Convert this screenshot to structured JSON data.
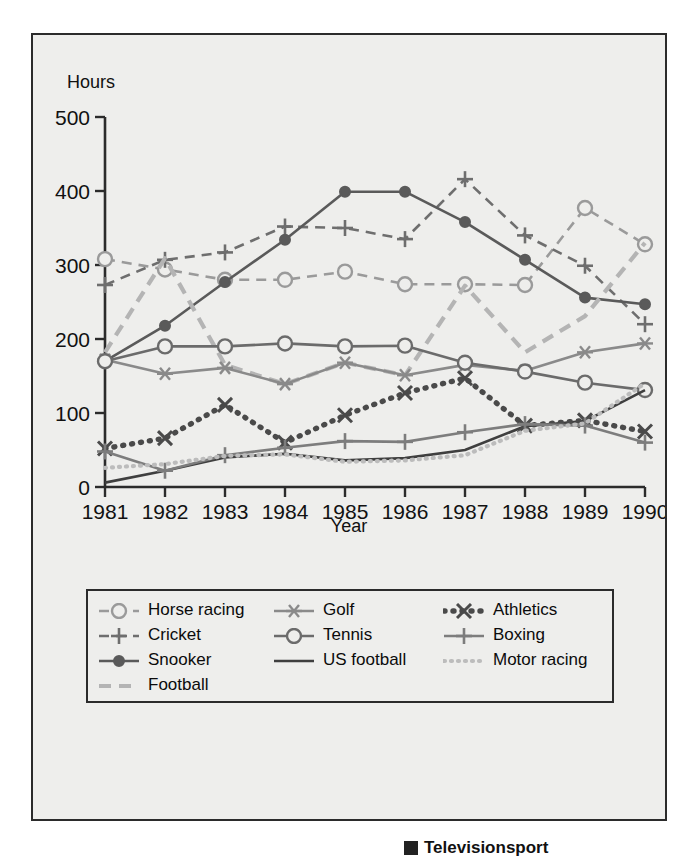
{
  "figure": {
    "background": "#eeeeec",
    "border_color": "#2b2b2b"
  },
  "axes": {
    "y_title": "Hours",
    "x_title": "Year",
    "y_ticks": [
      "0",
      "100",
      "200",
      "300",
      "400",
      "500"
    ],
    "x_ticks": [
      "1981",
      "1982",
      "1983",
      "1984",
      "1985",
      "1986",
      "1987",
      "1988",
      "1989",
      "1990"
    ]
  },
  "legend": {
    "columns": [
      [
        {
          "label": "Horse racing",
          "key": "horse_racing"
        },
        {
          "label": "Cricket",
          "key": "cricket"
        },
        {
          "label": "Snooker",
          "key": "snooker"
        },
        {
          "label": "Football",
          "key": "football"
        }
      ],
      [
        {
          "label": "Golf",
          "key": "golf"
        },
        {
          "label": "Tennis",
          "key": "tennis"
        },
        {
          "label": "US football",
          "key": "us_football"
        }
      ],
      [
        {
          "label": "Athletics",
          "key": "athletics"
        },
        {
          "label": "Boxing",
          "key": "boxing"
        },
        {
          "label": "Motor racing",
          "key": "motor_racing"
        }
      ]
    ]
  },
  "caption": {
    "marker": "square-bullet",
    "text": "Televisionsport"
  },
  "chart_data": {
    "type": "line",
    "title": "",
    "xlabel": "Year",
    "ylabel": "Hours",
    "x": [
      "1981",
      "1982",
      "1983",
      "1984",
      "1985",
      "1986",
      "1987",
      "1988",
      "1989",
      "1990"
    ],
    "xlim": [
      1981,
      1990
    ],
    "ylim": [
      0,
      500
    ],
    "yticks": [
      0,
      100,
      200,
      300,
      400,
      500
    ],
    "grid": false,
    "legend_position": "below-axes",
    "series": [
      {
        "name": "Horse racing",
        "key": "horse_racing",
        "marker": "open-circle",
        "linestyle": "dashed",
        "color": "#9a9a9a",
        "values": [
          308,
          294,
          280,
          280,
          291,
          274,
          274,
          273,
          377,
          328
        ]
      },
      {
        "name": "Cricket",
        "key": "cricket",
        "marker": "plus",
        "linestyle": "dashed",
        "color": "#6e6e6e",
        "values": [
          273,
          307,
          317,
          352,
          350,
          335,
          416,
          340,
          299,
          220
        ]
      },
      {
        "name": "Snooker",
        "key": "snooker",
        "marker": "filled-circle",
        "linestyle": "solid",
        "color": "#5a5a5a",
        "values": [
          170,
          218,
          277,
          334,
          399,
          399,
          358,
          307,
          256,
          247
        ]
      },
      {
        "name": "Football",
        "key": "football",
        "marker": "none",
        "linestyle": "dashed-thick",
        "color": "#b4b4b4",
        "values": [
          182,
          309,
          165,
          139,
          168,
          151,
          272,
          182,
          231,
          330
        ]
      },
      {
        "name": "Golf",
        "key": "golf",
        "marker": "star",
        "linestyle": "solid",
        "color": "#8a8a8a",
        "values": [
          172,
          153,
          161,
          139,
          168,
          151,
          165,
          157,
          182,
          194
        ]
      },
      {
        "name": "Tennis",
        "key": "tennis",
        "marker": "open-circle",
        "linestyle": "solid",
        "color": "#6b6b6b",
        "values": [
          170,
          190,
          190,
          194,
          190,
          191,
          168,
          156,
          141,
          131
        ]
      },
      {
        "name": "US football",
        "key": "us_football",
        "marker": "none",
        "linestyle": "solid",
        "color": "#3f3f3f",
        "values": [
          6,
          22,
          40,
          45,
          36,
          39,
          50,
          82,
          89,
          131
        ]
      },
      {
        "name": "Athletics",
        "key": "athletics",
        "marker": "x",
        "linestyle": "dotted-thick",
        "color": "#4a4a4a",
        "values": [
          52,
          66,
          111,
          60,
          97,
          127,
          147,
          83,
          90,
          75
        ]
      },
      {
        "name": "Boxing",
        "key": "boxing",
        "marker": "plus",
        "linestyle": "solid",
        "color": "#7d7d7d",
        "values": [
          48,
          22,
          43,
          53,
          62,
          61,
          74,
          85,
          83,
          60
        ]
      },
      {
        "name": "Motor racing",
        "key": "motor_racing",
        "marker": "none",
        "linestyle": "dotted",
        "color": "#bcbcbc",
        "values": [
          26,
          31,
          42,
          44,
          34,
          36,
          43,
          76,
          86,
          140
        ]
      }
    ]
  }
}
